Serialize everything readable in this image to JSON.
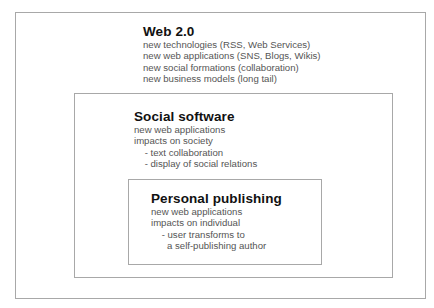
{
  "diagram": {
    "outer": {
      "title": "Web 2.0",
      "lines": [
        "new technologies (RSS, Web Services)",
        "new web applications (SNS, Blogs, Wikis)",
        "new social formations (collaboration)",
        "new business models (long tail)"
      ]
    },
    "middle": {
      "title": "Social software",
      "lines": [
        "new web applications",
        "impacts on society",
        "    - text collaboration",
        "    - display of social relations"
      ]
    },
    "inner": {
      "title": "Personal publishing",
      "lines": [
        "new web applications",
        "impacts on individual",
        "    - user transforms to",
        "      a self-publishing author"
      ]
    }
  }
}
